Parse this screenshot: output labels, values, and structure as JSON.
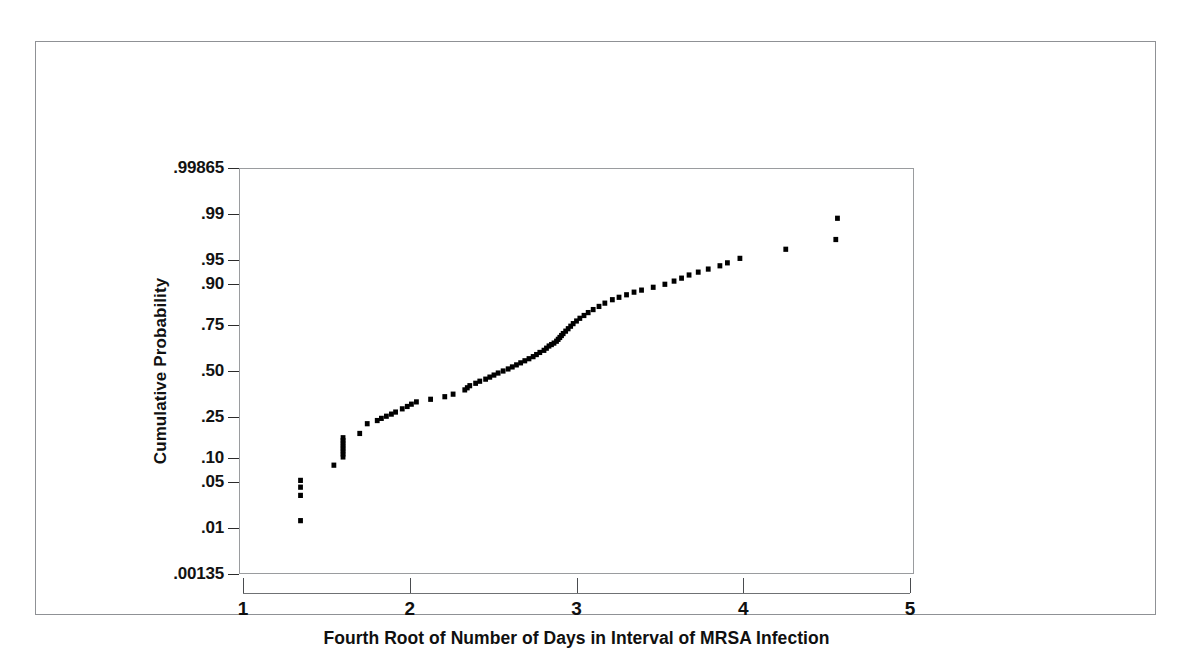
{
  "figure": {
    "background": "#ffffff",
    "border_color": "#8f9195",
    "point_color": "#000000"
  },
  "chart_data": {
    "type": "scatter",
    "title": "",
    "subtitle": "",
    "xlabel": "Fourth Root of Number of Days in Interval of MRSA Infection",
    "ylabel": "Cumulative Probability",
    "xlim": [
      1,
      5
    ],
    "ylim": [
      0.00135,
      0.99865
    ],
    "yscale": "probit",
    "grid": false,
    "legend": null,
    "xticks": [
      1,
      2,
      3,
      4,
      5
    ],
    "xticklabels": [
      "1",
      "2",
      "3",
      "4",
      "5"
    ],
    "yticks": [
      0.00135,
      0.01,
      0.05,
      0.1,
      0.25,
      0.5,
      0.75,
      0.9,
      0.95,
      0.99,
      0.99865
    ],
    "yticklabels": [
      ".00135",
      ".01",
      ".05",
      ".10",
      ".25",
      ".50",
      ".75",
      ".90",
      ".95",
      ".99",
      ".99865"
    ],
    "marker": "square",
    "marker_size": 5,
    "series": [
      {
        "name": "MRSA interval probability plot",
        "x": [
          1.345,
          1.345,
          1.345,
          1.345,
          1.545,
          1.6,
          1.6,
          1.6,
          1.6,
          1.6,
          1.6,
          1.6,
          1.6,
          1.7,
          1.745,
          1.805,
          1.83,
          1.86,
          1.89,
          1.915,
          1.955,
          1.985,
          2.01,
          2.04,
          2.125,
          2.21,
          2.26,
          2.33,
          2.345,
          2.36,
          2.395,
          2.42,
          2.455,
          2.48,
          2.505,
          2.53,
          2.56,
          2.59,
          2.615,
          2.64,
          2.665,
          2.69,
          2.715,
          2.74,
          2.76,
          2.78,
          2.805,
          2.82,
          2.835,
          2.85,
          2.865,
          2.88,
          2.89,
          2.9,
          2.91,
          2.92,
          2.935,
          2.95,
          2.965,
          2.98,
          3.0,
          3.02,
          3.045,
          3.07,
          3.1,
          3.135,
          3.17,
          3.215,
          3.255,
          3.3,
          3.345,
          3.39,
          3.46,
          3.53,
          3.585,
          3.63,
          3.675,
          3.73,
          3.79,
          3.86,
          3.905,
          3.98,
          4.255,
          4.555,
          4.565
        ],
        "y": [
          0.0135,
          0.033,
          0.043,
          0.053,
          0.082,
          0.102,
          0.11,
          0.118,
          0.126,
          0.134,
          0.143,
          0.152,
          0.162,
          0.178,
          0.218,
          0.232,
          0.242,
          0.252,
          0.262,
          0.272,
          0.288,
          0.3,
          0.312,
          0.324,
          0.338,
          0.352,
          0.366,
          0.39,
          0.402,
          0.414,
          0.428,
          0.44,
          0.452,
          0.464,
          0.476,
          0.488,
          0.5,
          0.512,
          0.524,
          0.536,
          0.548,
          0.56,
          0.572,
          0.584,
          0.596,
          0.608,
          0.62,
          0.632,
          0.644,
          0.652,
          0.66,
          0.67,
          0.68,
          0.69,
          0.7,
          0.71,
          0.722,
          0.734,
          0.746,
          0.758,
          0.77,
          0.782,
          0.794,
          0.806,
          0.818,
          0.83,
          0.842,
          0.854,
          0.862,
          0.87,
          0.878,
          0.884,
          0.892,
          0.9,
          0.908,
          0.915,
          0.922,
          0.928,
          0.934,
          0.94,
          0.945,
          0.952,
          0.964,
          0.974,
          0.988
        ]
      }
    ]
  }
}
